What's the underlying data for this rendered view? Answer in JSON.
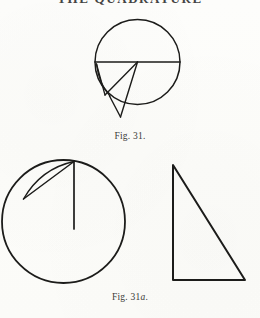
{
  "page": {
    "width": 260,
    "height": 318,
    "background_color": "#fdfdfb",
    "ink_color": "#1c1c1a",
    "running_head": "THE QUADRATURE"
  },
  "captions": {
    "fig31": {
      "prefix": "Fig.",
      "number": "31",
      "suffix": "",
      "period": ".",
      "full": "Fig. 31."
    },
    "fig31a": {
      "prefix": "Fig.",
      "number": "31",
      "suffix": "a",
      "period": ".",
      "full": "Fig. 31a."
    }
  },
  "figures": [
    {
      "id": "fig31",
      "name": "circle-with-diameter-and-wedge",
      "circle": {
        "cx": 137.5,
        "cy": 62,
        "r": 42.5
      },
      "diameter": {
        "x1": 95,
        "y1": 62,
        "x2": 180,
        "y2": 62
      },
      "wedge_apex": {
        "x": 120,
        "y": 116
      },
      "wedge_left_vertex": {
        "x": 104,
        "y": 95
      },
      "wedge_lines": [
        {
          "x1": 96.5,
          "y1": 64,
          "x2": 104,
          "y2": 95
        },
        {
          "x1": 104,
          "y1": 95,
          "x2": 137.5,
          "y2": 62
        },
        {
          "x1": 137.5,
          "y1": 62,
          "x2": 120,
          "y2": 116
        },
        {
          "x1": 120,
          "y1": 116,
          "x2": 110,
          "y2": 96
        }
      ],
      "sliver_curve": {
        "from_x": 96.5,
        "from_y": 64,
        "to_x": 110,
        "to_y": 96,
        "ctrl_x": 99,
        "ctrl_y": 84
      }
    },
    {
      "id": "fig31a-circle",
      "name": "circle-with-radius-and-sliver",
      "circle": {
        "cx": 63.5,
        "cy": 221.5,
        "r": 61.5
      },
      "radius": {
        "x1": 74,
        "y1": 162,
        "x2": 74,
        "y2": 228
      },
      "chord": {
        "x1": 74,
        "y1": 162,
        "x2": 23,
        "y2": 199
      },
      "sliver_curve": {
        "from_x": 74,
        "from_y": 162,
        "to_x": 23,
        "to_y": 199,
        "ctrl_x": 40,
        "ctrl_y": 168
      }
    },
    {
      "id": "fig31a-triangle",
      "name": "right-triangle",
      "apex": {
        "x": 173,
        "y": 165
      },
      "bottom_left": {
        "x": 173,
        "y": 280
      },
      "bottom_right": {
        "x": 245,
        "y": 280
      }
    }
  ]
}
